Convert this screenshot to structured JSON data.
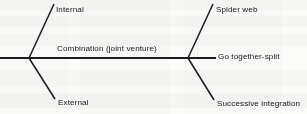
{
  "diagram": {
    "type": "bowtie-fishbone",
    "stroke_color": "#1c1c1e",
    "background_color": "#fbfbfa",
    "spine": {
      "label": "Combination (joint venture)",
      "x1": 0,
      "y1": 58,
      "x2": 216,
      "y2": 58
    },
    "left_node": {
      "x": 29,
      "y": 58
    },
    "right_node": {
      "x": 188,
      "y": 58
    },
    "branches": [
      {
        "id": "internal",
        "label": "Internal",
        "side": "left",
        "direction": "up",
        "line": {
          "x1": 29,
          "y1": 58,
          "x2": 54,
          "y2": 4
        },
        "label_x": 56,
        "label_y": 6
      },
      {
        "id": "external",
        "label": "External",
        "side": "left",
        "direction": "down",
        "line": {
          "x1": 29,
          "y1": 58,
          "x2": 55,
          "y2": 99
        },
        "label_x": 58,
        "label_y": 99
      },
      {
        "id": "spider-web",
        "label": "Spider web",
        "side": "right",
        "direction": "up",
        "line": {
          "x1": 188,
          "y1": 58,
          "x2": 213,
          "y2": 4
        },
        "label_x": 216,
        "label_y": 6
      },
      {
        "id": "go-together-split",
        "label": "Go together-split",
        "side": "right",
        "direction": "straight",
        "line": {
          "x1": 188,
          "y1": 58,
          "x2": 216,
          "y2": 58
        },
        "label_x": 218,
        "label_y": 54
      },
      {
        "id": "successive-integration",
        "label": "Successive integration",
        "side": "right",
        "direction": "down",
        "line": {
          "x1": 188,
          "y1": 58,
          "x2": 214,
          "y2": 100
        },
        "label_x": 217,
        "label_y": 100
      }
    ]
  }
}
